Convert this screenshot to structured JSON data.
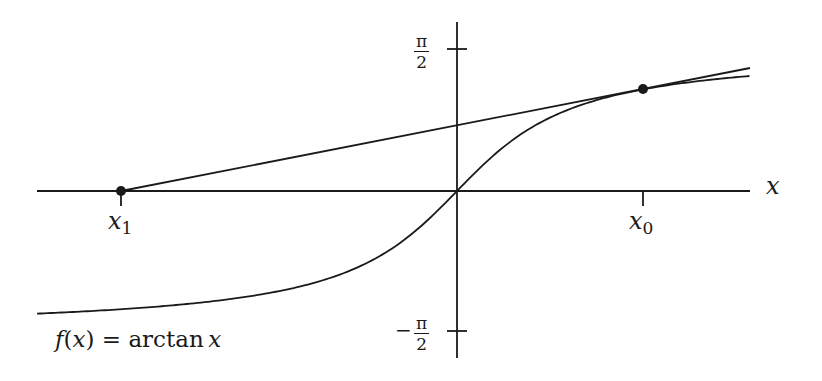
{
  "chart_data": {
    "type": "line",
    "title": "",
    "function_label": "f(x) = arctan x",
    "xlabel": "x",
    "ylabel": "",
    "y_ticks": [
      {
        "label": "π/2",
        "value": 1.5708
      },
      {
        "label": "−π/2",
        "value": -1.5708
      }
    ],
    "x_marks": [
      {
        "label": "x1",
        "description": "x-intercept of tangent line",
        "value": -3.85
      },
      {
        "label": "x0",
        "description": "point of tangency",
        "value": 2.13
      }
    ],
    "series": [
      {
        "name": "f(x) = arctan x",
        "kind": "curve",
        "x_range": [
          -4.81,
          3.35
        ]
      },
      {
        "name": "tangent line at x0",
        "kind": "line",
        "points": [
          [
            -3.85,
            0
          ],
          [
            3.35,
            1.37
          ]
        ]
      }
    ],
    "points": [
      {
        "name": "x1 point",
        "x": -3.85,
        "y": 0
      },
      {
        "name": "x0 point",
        "x": 2.13,
        "y": 1.136
      }
    ],
    "ylim": [
      -1.85,
      1.9
    ],
    "xlim": [
      -4.8,
      3.35
    ],
    "grid": false,
    "legend": "none"
  },
  "labels": {
    "x_axis": "x",
    "x1_main": "x",
    "x1_sub": "1",
    "x0_main": "x",
    "x0_sub": "0",
    "pi_num": "π",
    "pi_den": "2",
    "neg_sign": "−",
    "formula_f": "f",
    "formula_open": "(",
    "formula_x": "x",
    "formula_close": ")",
    "formula_eq": " = ",
    "formula_fn": "arctan",
    "formula_arg": "x"
  },
  "colors": {
    "ink": "#1a1a1a",
    "background": "#ffffff"
  }
}
